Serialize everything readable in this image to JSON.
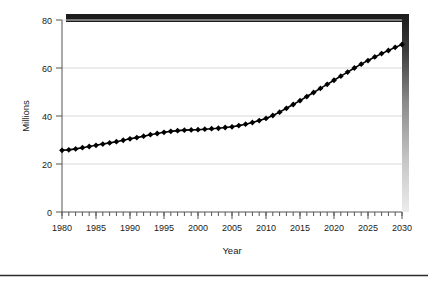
{
  "chart_data": {
    "type": "line",
    "title": "",
    "xlabel": "Year",
    "ylabel": "Millions",
    "xlim": [
      1980,
      2030
    ],
    "ylim": [
      0,
      80
    ],
    "grid": true,
    "legend": null,
    "marker": "diamond",
    "line_color": "#000000",
    "xticks": [
      1980,
      1985,
      1990,
      1995,
      2000,
      2005,
      2010,
      2015,
      2020,
      2025,
      2030
    ],
    "xtick_labels": [
      "1980",
      "1985",
      "1990",
      "1995",
      "2000",
      "2005",
      "2010",
      "2015",
      "2020",
      "2025",
      "2030"
    ],
    "minor_xtick_interval": 1,
    "yticks": [
      0,
      20,
      40,
      60,
      80
    ],
    "ytick_labels": [
      "0",
      "20",
      "40",
      "60",
      "80"
    ],
    "x": [
      1980,
      1981,
      1982,
      1983,
      1984,
      1985,
      1986,
      1987,
      1988,
      1989,
      1990,
      1991,
      1992,
      1993,
      1994,
      1995,
      1996,
      1997,
      1998,
      1999,
      2000,
      2001,
      2002,
      2003,
      2004,
      2005,
      2006,
      2007,
      2008,
      2009,
      2010,
      2011,
      2012,
      2013,
      2014,
      2015,
      2016,
      2017,
      2018,
      2019,
      2020,
      2021,
      2022,
      2023,
      2024,
      2025,
      2026,
      2027,
      2028,
      2029,
      2030
    ],
    "values": [
      25.7,
      25.9,
      26.3,
      26.8,
      27.3,
      27.8,
      28.3,
      28.8,
      29.3,
      29.9,
      30.5,
      31.0,
      31.6,
      32.2,
      32.7,
      33.2,
      33.6,
      33.9,
      34.1,
      34.2,
      34.3,
      34.5,
      34.7,
      34.9,
      35.2,
      35.5,
      36.0,
      36.6,
      37.3,
      38.1,
      39.0,
      40.2,
      41.6,
      43.2,
      44.8,
      46.4,
      48.1,
      49.8,
      51.5,
      53.2,
      54.9,
      56.6,
      58.3,
      60.0,
      61.6,
      63.1,
      64.6,
      66.0,
      67.3,
      68.6,
      69.8
    ]
  },
  "decor": {
    "top_bar_color": "#1c1c1c",
    "shadow_top_color": "#1c1c1c",
    "shadow_bottom_color": "#e8e8e8",
    "bottom_rule_color": "#2b2b2b"
  }
}
